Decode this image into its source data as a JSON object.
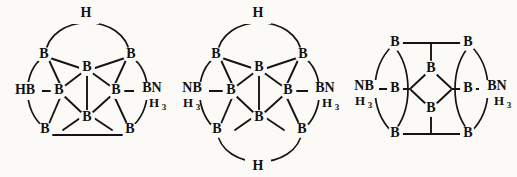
{
  "figure": {
    "background_color": "#fbfaf6",
    "line_color": "#141414",
    "structure_count": 3
  },
  "labels": {
    "boron": "B",
    "hydrogen": "H",
    "h_sub3": "3",
    "hb_terminal": "HB",
    "bn_terminal": "BN",
    "nb_terminal": "NB",
    "nh3_sub": "H"
  },
  "structures": [
    {
      "id": "structure-1",
      "name": "borane-cage-monoammoniate",
      "left_terminal": "HB",
      "right_terminal": "BN",
      "right_terminal_sub": "H",
      "right_terminal_sub_index": "3",
      "top_bridge": "H",
      "bottom_bridge": null,
      "boron_count": 8,
      "atoms": [
        {
          "label": "B",
          "role": "top-left-corner"
        },
        {
          "label": "B",
          "role": "top-right-corner"
        },
        {
          "label": "B",
          "role": "top-center"
        },
        {
          "label": "B",
          "role": "mid-left"
        },
        {
          "label": "B",
          "role": "mid-right"
        },
        {
          "label": "B",
          "role": "bottom-center"
        },
        {
          "label": "B",
          "role": "bottom-left-corner"
        },
        {
          "label": "B",
          "role": "bottom-right-corner"
        }
      ]
    },
    {
      "id": "structure-2",
      "name": "borane-cage-diammoniate-bridged",
      "left_terminal": "NB",
      "left_terminal_sub": "H",
      "left_terminal_sub_index": "3",
      "right_terminal": "BN",
      "right_terminal_sub": "H",
      "right_terminal_sub_index": "3",
      "top_bridge": "H",
      "bottom_bridge": "H",
      "boron_count": 8,
      "atoms": [
        {
          "label": "B",
          "role": "top-left-corner"
        },
        {
          "label": "B",
          "role": "top-right-corner"
        },
        {
          "label": "B",
          "role": "top-center"
        },
        {
          "label": "B",
          "role": "mid-left"
        },
        {
          "label": "B",
          "role": "mid-right"
        },
        {
          "label": "B",
          "role": "bottom-center"
        },
        {
          "label": "B",
          "role": "bottom-left-corner"
        },
        {
          "label": "B",
          "role": "bottom-right-corner"
        }
      ]
    },
    {
      "id": "structure-3",
      "name": "borane-cage-diammoniate-diamond",
      "left_terminal": "NB",
      "left_terminal_sub": "H",
      "left_terminal_sub_index": "3",
      "right_terminal": "BN",
      "right_terminal_sub": "H",
      "right_terminal_sub_index": "3",
      "top_bridge": null,
      "bottom_bridge": null,
      "boron_count": 8,
      "atoms": [
        {
          "label": "B",
          "role": "top-left-corner"
        },
        {
          "label": "B",
          "role": "top-right-corner"
        },
        {
          "label": "B",
          "role": "center-top"
        },
        {
          "label": "B",
          "role": "mid-left"
        },
        {
          "label": "B",
          "role": "mid-right"
        },
        {
          "label": "B",
          "role": "center-bottom"
        },
        {
          "label": "B",
          "role": "bottom-left-corner"
        },
        {
          "label": "B",
          "role": "bottom-right-corner"
        }
      ]
    }
  ]
}
